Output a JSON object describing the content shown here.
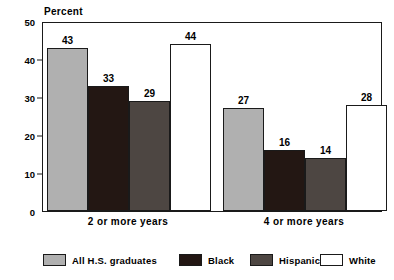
{
  "chart_data": {
    "type": "bar",
    "title": "",
    "subtitle": "",
    "xlabel": "",
    "ylabel": "Percent",
    "ylim": [
      0,
      50
    ],
    "yticks": [
      0,
      10,
      20,
      30,
      40,
      50
    ],
    "ytick_labels": [
      "0",
      "10",
      "20",
      "30",
      "40",
      "50"
    ],
    "grid": false,
    "legend_position": "bottom",
    "categories": [
      "2 or more years",
      "4 or more years"
    ],
    "series": [
      {
        "name": "All H.S. graduates",
        "color": "#b0b0b0",
        "values": [
          43,
          27
        ]
      },
      {
        "name": "Black",
        "color": "#231713",
        "values": [
          33,
          16
        ]
      },
      {
        "name": "Hispanic",
        "color": "#4d4642",
        "values": [
          29,
          14
        ]
      },
      {
        "name": "White",
        "color": "#ffffff",
        "values": [
          44,
          28
        ]
      }
    ],
    "data_labels": [
      [
        "43",
        "33",
        "29",
        "44"
      ],
      [
        "27",
        "16",
        "14",
        "28"
      ]
    ]
  },
  "legend": {
    "items": [
      {
        "label": "All H.S. graduates"
      },
      {
        "label": "Black"
      },
      {
        "label": "Hispanic"
      },
      {
        "label": "White"
      }
    ]
  }
}
